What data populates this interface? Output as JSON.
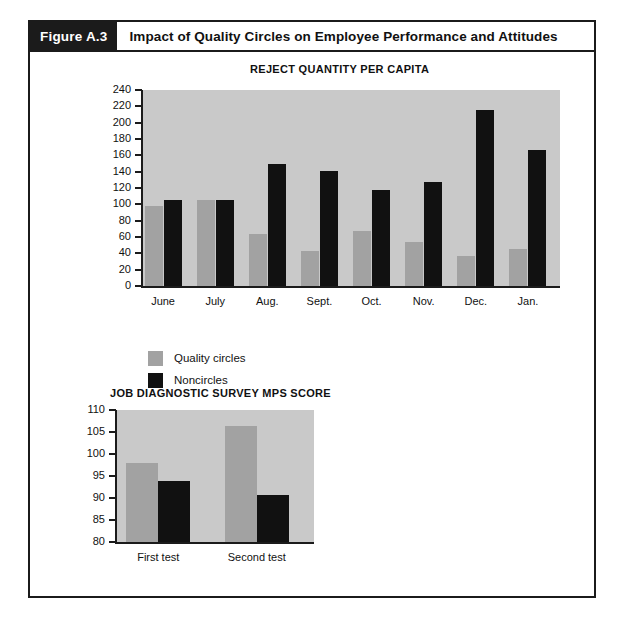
{
  "figure": {
    "number": "Figure A.3",
    "title": "Impact of Quality Circles on Employee Performance and Attitudes"
  },
  "legend": {
    "items": [
      {
        "label": "Quality circles",
        "color": "#a2a2a2",
        "key": "quality"
      },
      {
        "label": "Noncircles",
        "color": "#111111",
        "key": "noncircle"
      }
    ]
  },
  "colors": {
    "quality_circles": "#a2a2a2",
    "noncircles": "#111111",
    "plot_background": "#c9c9c9",
    "frame": "#1b1b1b",
    "page_background": "#ffffff"
  },
  "chart_data": [
    {
      "id": "reject-quantity-chart",
      "type": "bar",
      "title": "REJECT QUANTITY PER CAPITA",
      "xlabel": "",
      "ylabel": "",
      "ylim": [
        0,
        240
      ],
      "yticks": [
        0,
        20,
        40,
        60,
        80,
        100,
        120,
        140,
        160,
        180,
        200,
        220,
        240
      ],
      "grid": false,
      "legend_position": "below-left",
      "categories": [
        "June",
        "July",
        "Aug.",
        "Sept.",
        "Oct.",
        "Nov.",
        "Dec.",
        "Jan."
      ],
      "series": [
        {
          "name": "Quality circles",
          "color": "#a2a2a2",
          "values": [
            98,
            105,
            64,
            43,
            67,
            54,
            37,
            45
          ]
        },
        {
          "name": "Noncircles",
          "color": "#111111",
          "values": [
            105,
            105,
            149,
            141,
            118,
            127,
            216,
            167
          ]
        }
      ]
    },
    {
      "id": "mps-score-chart",
      "type": "bar",
      "title": "JOB DIAGNOSTIC SURVEY MPS SCORE",
      "xlabel": "",
      "ylabel": "",
      "ylim": [
        80,
        110
      ],
      "yticks": [
        80,
        85,
        90,
        95,
        100,
        105,
        110
      ],
      "grid": false,
      "legend_position": "none",
      "categories": [
        "First test",
        "Second test"
      ],
      "series": [
        {
          "name": "Quality circles",
          "color": "#a2a2a2",
          "values": [
            98.0,
            106.3
          ]
        },
        {
          "name": "Noncircles",
          "color": "#111111",
          "values": [
            93.8,
            90.7
          ]
        }
      ]
    }
  ]
}
